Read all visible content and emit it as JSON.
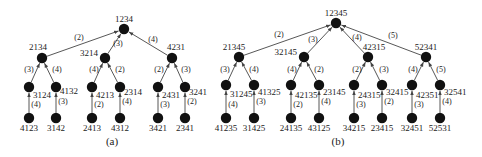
{
  "figure": {
    "captions": {
      "a": "(a)",
      "b": "(b)"
    },
    "colors": {
      "node": "#111111",
      "edge": "#444444",
      "text": "#222222",
      "background": "#ffffff"
    }
  },
  "trees": [
    {
      "id": "a",
      "caption": "(a)",
      "caption_pos": [
        112,
        145
      ],
      "nodes": [
        {
          "id": "1234",
          "label": "1234",
          "x": 124,
          "y": 29,
          "lx": 124,
          "ly": 22,
          "anchor": "middle"
        },
        {
          "id": "2134",
          "label": "2134",
          "x": 42,
          "y": 58,
          "lx": 38,
          "ly": 50,
          "anchor": "middle"
        },
        {
          "id": "3214",
          "label": "3214",
          "x": 105,
          "y": 58,
          "lx": 98,
          "ly": 56,
          "anchor": "end"
        },
        {
          "id": "4231",
          "label": "4231",
          "x": 172,
          "y": 58,
          "lx": 176,
          "ly": 50,
          "anchor": "middle"
        },
        {
          "id": "3124n",
          "label": "",
          "x": 29,
          "y": 87
        },
        {
          "id": "4132n",
          "label": "",
          "x": 56,
          "y": 87
        },
        {
          "id": "4213n",
          "label": "",
          "x": 92,
          "y": 87
        },
        {
          "id": "2314n",
          "label": "",
          "x": 120,
          "y": 87
        },
        {
          "id": "2431n",
          "label": "",
          "x": 158,
          "y": 87
        },
        {
          "id": "3241n",
          "label": "",
          "x": 185,
          "y": 87
        },
        {
          "id": "4123",
          "label": "4123",
          "x": 29,
          "y": 118,
          "lx": 29,
          "ly": 131,
          "anchor": "middle"
        },
        {
          "id": "3142",
          "label": "3142",
          "x": 56,
          "y": 118,
          "lx": 56,
          "ly": 131,
          "anchor": "middle"
        },
        {
          "id": "2413",
          "label": "2413",
          "x": 92,
          "y": 118,
          "lx": 92,
          "ly": 131,
          "anchor": "middle"
        },
        {
          "id": "4312",
          "label": "4312",
          "x": 120,
          "y": 118,
          "lx": 120,
          "ly": 131,
          "anchor": "middle"
        },
        {
          "id": "3421",
          "label": "3421",
          "x": 158,
          "y": 118,
          "lx": 158,
          "ly": 131,
          "anchor": "middle"
        },
        {
          "id": "2341",
          "label": "2341",
          "x": 185,
          "y": 118,
          "lx": 185,
          "ly": 131,
          "anchor": "middle"
        }
      ],
      "edges": [
        {
          "from": "2134",
          "to": "1234",
          "label": "(2)",
          "lx": 79,
          "ly": 40
        },
        {
          "from": "3214",
          "to": "1234",
          "label": "(3)",
          "lx": 118,
          "ly": 46
        },
        {
          "from": "4231",
          "to": "1234",
          "label": "(4)",
          "lx": 153,
          "ly": 42
        },
        {
          "from": "3124n",
          "to": "2134",
          "label": "(3)",
          "lx": 29,
          "ly": 72
        },
        {
          "from": "4132n",
          "to": "2134",
          "label": "(4)",
          "lx": 57,
          "ly": 72
        },
        {
          "from": "4213n",
          "to": "3214",
          "label": "(4)",
          "lx": 94,
          "ly": 72
        },
        {
          "from": "2314n",
          "to": "3214",
          "label": "(2)",
          "lx": 120,
          "ly": 72
        },
        {
          "from": "2431n",
          "to": "4231",
          "label": "(2)",
          "lx": 159,
          "ly": 72
        },
        {
          "from": "3241n",
          "to": "4231",
          "label": "(3)",
          "lx": 186,
          "ly": 72
        },
        {
          "from": "4123",
          "to": "3124n",
          "label": "(4)",
          "lx": 36,
          "ly": 107,
          "tag": "3124",
          "tx": 33,
          "ty": 98
        },
        {
          "from": "3142",
          "to": "4132n",
          "label": "(3)",
          "lx": 63,
          "ly": 104,
          "tag": "4132",
          "tx": 60,
          "ty": 94
        },
        {
          "from": "2413",
          "to": "4213n",
          "label": "(2)",
          "lx": 99,
          "ly": 107,
          "tag": "4213",
          "tx": 96,
          "ty": 98
        },
        {
          "from": "4312",
          "to": "2314n",
          "label": "(4)",
          "lx": 127,
          "ly": 104,
          "tag": "2314",
          "tx": 124,
          "ty": 95
        },
        {
          "from": "3421",
          "to": "2431n",
          "label": "(3)",
          "lx": 165,
          "ly": 107,
          "tag": "2431",
          "tx": 162,
          "ty": 98
        },
        {
          "from": "2341",
          "to": "3241n",
          "label": "(2)",
          "lx": 192,
          "ly": 104,
          "tag": "3241",
          "tx": 189,
          "ty": 95
        }
      ]
    },
    {
      "id": "b",
      "caption": "(b)",
      "caption_pos": [
        338,
        145
      ],
      "nodes": [
        {
          "id": "12345",
          "label": "12345",
          "x": 336,
          "y": 23,
          "lx": 336,
          "ly": 16,
          "anchor": "middle"
        },
        {
          "id": "21345",
          "label": "21345",
          "x": 239,
          "y": 57,
          "lx": 234,
          "ly": 50,
          "anchor": "middle"
        },
        {
          "id": "32145",
          "label": "32145",
          "x": 304,
          "y": 57,
          "lx": 297,
          "ly": 55,
          "anchor": "end"
        },
        {
          "id": "42315",
          "label": "42315",
          "x": 368,
          "y": 57,
          "lx": 374,
          "ly": 50,
          "anchor": "middle"
        },
        {
          "id": "52341",
          "label": "52341",
          "x": 426,
          "y": 57,
          "lx": 426,
          "ly": 50,
          "anchor": "middle"
        },
        {
          "id": "31245n",
          "label": "",
          "x": 226,
          "y": 85
        },
        {
          "id": "41325n",
          "label": "",
          "x": 254,
          "y": 85
        },
        {
          "id": "42135n",
          "label": "",
          "x": 291,
          "y": 85
        },
        {
          "id": "23145n",
          "label": "",
          "x": 319,
          "y": 85
        },
        {
          "id": "24315n",
          "label": "",
          "x": 354,
          "y": 85
        },
        {
          "id": "32415n",
          "label": "",
          "x": 382,
          "y": 85
        },
        {
          "id": "42351n",
          "label": "",
          "x": 412,
          "y": 85
        },
        {
          "id": "32541n",
          "label": "",
          "x": 440,
          "y": 85
        },
        {
          "id": "41235",
          "label": "41235",
          "x": 226,
          "y": 118,
          "lx": 226,
          "ly": 131,
          "anchor": "middle"
        },
        {
          "id": "31425",
          "label": "31425",
          "x": 254,
          "y": 118,
          "lx": 254,
          "ly": 131,
          "anchor": "middle"
        },
        {
          "id": "24135",
          "label": "24135",
          "x": 291,
          "y": 118,
          "lx": 291,
          "ly": 131,
          "anchor": "middle"
        },
        {
          "id": "43125",
          "label": "43125",
          "x": 319,
          "y": 118,
          "lx": 319,
          "ly": 131,
          "anchor": "middle"
        },
        {
          "id": "34215",
          "label": "34215",
          "x": 354,
          "y": 118,
          "lx": 354,
          "ly": 131,
          "anchor": "middle"
        },
        {
          "id": "23415",
          "label": "23415",
          "x": 382,
          "y": 118,
          "lx": 382,
          "ly": 131,
          "anchor": "middle"
        },
        {
          "id": "32451",
          "label": "32451",
          "x": 412,
          "y": 118,
          "lx": 412,
          "ly": 131,
          "anchor": "middle"
        },
        {
          "id": "52531",
          "label": "52531",
          "x": 440,
          "y": 118,
          "lx": 440,
          "ly": 131,
          "anchor": "middle"
        }
      ],
      "edges": [
        {
          "from": "21345",
          "to": "12345",
          "label": "(2)",
          "lx": 279,
          "ly": 37
        },
        {
          "from": "32145",
          "to": "12345",
          "label": "(3)",
          "lx": 313,
          "ly": 42
        },
        {
          "from": "42315",
          "to": "12345",
          "label": "(4)",
          "lx": 357,
          "ly": 40
        },
        {
          "from": "52341",
          "to": "12345",
          "label": "(5)",
          "lx": 393,
          "ly": 38
        },
        {
          "from": "31245n",
          "to": "21345",
          "label": "(3)",
          "lx": 225,
          "ly": 72
        },
        {
          "from": "41325n",
          "to": "21345",
          "label": "(4)",
          "lx": 254,
          "ly": 72
        },
        {
          "from": "42135n",
          "to": "32145",
          "label": "(4)",
          "lx": 292,
          "ly": 72
        },
        {
          "from": "23145n",
          "to": "32145",
          "label": "(2)",
          "lx": 319,
          "ly": 72
        },
        {
          "from": "24315n",
          "to": "42315",
          "label": "(2)",
          "lx": 357,
          "ly": 72
        },
        {
          "from": "32415n",
          "to": "42315",
          "label": "(3)",
          "lx": 384,
          "ly": 72
        },
        {
          "from": "42351n",
          "to": "52341",
          "label": "(4)",
          "lx": 413,
          "ly": 72
        },
        {
          "from": "32541n",
          "to": "52341",
          "label": "(5)",
          "lx": 441,
          "ly": 72
        },
        {
          "from": "41235",
          "to": "31245n",
          "label": "(4)",
          "lx": 233,
          "ly": 107,
          "tag": "31245",
          "tx": 230,
          "ty": 97
        },
        {
          "from": "31425",
          "to": "41325n",
          "label": "(3)",
          "lx": 261,
          "ly": 104,
          "tag": "41325",
          "tx": 258,
          "ty": 95
        },
        {
          "from": "24135",
          "to": "42135n",
          "label": "(2)",
          "lx": 298,
          "ly": 107,
          "tag": "42135",
          "tx": 295,
          "ty": 98
        },
        {
          "from": "43125",
          "to": "23145n",
          "label": "(4)",
          "lx": 326,
          "ly": 104,
          "tag": "23145",
          "tx": 323,
          "ty": 95
        },
        {
          "from": "34215",
          "to": "24315n",
          "label": "(3)",
          "lx": 361,
          "ly": 107,
          "tag": "24315",
          "tx": 358,
          "ty": 98
        },
        {
          "from": "23415",
          "to": "32415n",
          "label": "(2)",
          "lx": 389,
          "ly": 104,
          "tag": "32415",
          "tx": 386,
          "ty": 95
        },
        {
          "from": "32451",
          "to": "42351n",
          "label": "(3)",
          "lx": 419,
          "ly": 107,
          "tag": "42351",
          "tx": 416,
          "ty": 98
        },
        {
          "from": "52531",
          "to": "32541n",
          "label": "(4)",
          "lx": 447,
          "ly": 104,
          "tag": "32541",
          "tx": 444,
          "ty": 95
        }
      ]
    }
  ]
}
